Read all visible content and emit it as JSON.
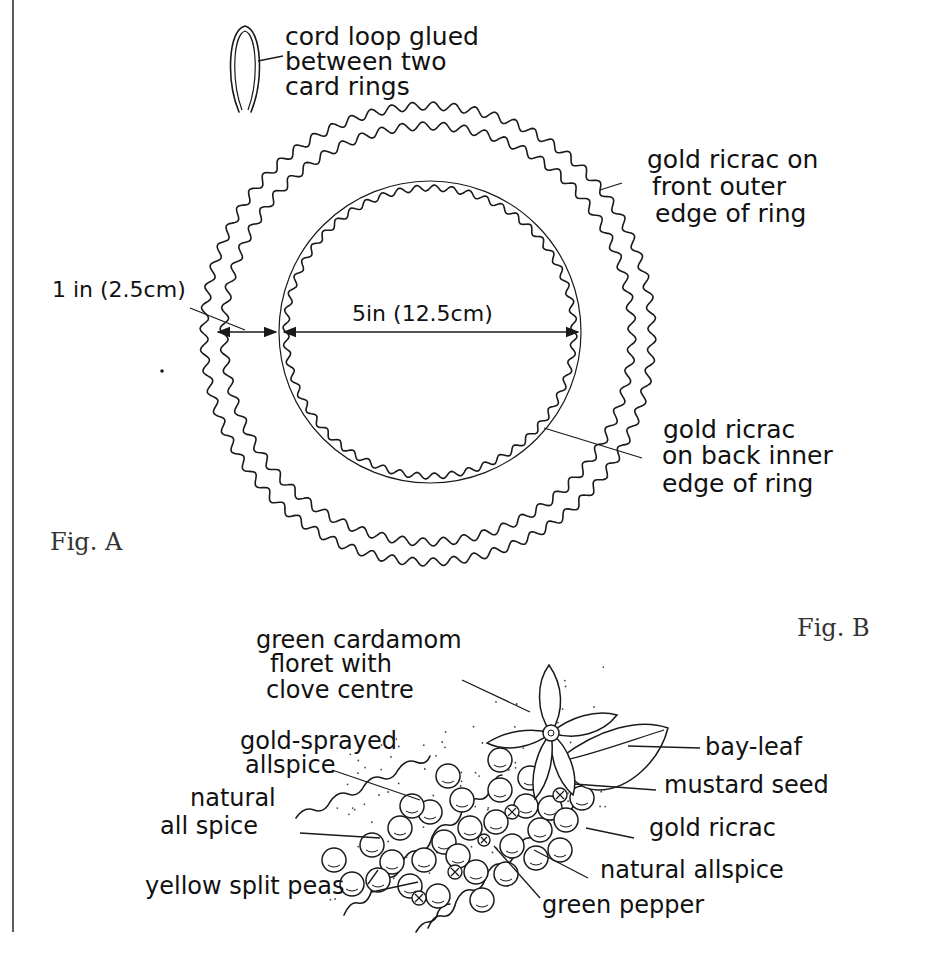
{
  "figure_a": {
    "label": "Fig. A",
    "callouts": {
      "loop": [
        "cord loop glued",
        "between two",
        "card rings"
      ],
      "outer_ricrac": [
        "gold ricrac on",
        "front outer",
        "edge of ring"
      ],
      "inner_ricrac": [
        "gold ricrac",
        "on back inner",
        "edge of ring"
      ]
    },
    "dimensions": {
      "ring_width": "1 in (2.5cm)",
      "inner_diameter": "5in (12.5cm)"
    }
  },
  "figure_b": {
    "label": "Fig. B",
    "callouts": {
      "cardamom": [
        "green cardamom",
        "floret with",
        "clove centre"
      ],
      "gold_allspice": [
        "gold-sprayed",
        "allspice"
      ],
      "natural_allspice_left": [
        "natural",
        "all spice"
      ],
      "split_peas": "yellow split peas",
      "bay_leaf": "bay-leaf",
      "mustard": "mustard seed",
      "ricrac": "gold ricrac",
      "natural_allspice_right": "natural allspice",
      "green_pepper": "green pepper"
    }
  },
  "colors": {
    "ink": "#1a1a1a",
    "caption": "#333333",
    "background": "#ffffff"
  }
}
